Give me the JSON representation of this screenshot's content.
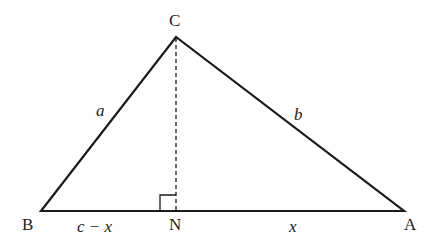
{
  "diagram": {
    "type": "triangle",
    "vertices": {
      "A": "A",
      "B": "B",
      "C": "C",
      "N": "N"
    },
    "sides": {
      "a": "a",
      "b": "b",
      "c_minus_x": "c − x",
      "x": "x"
    },
    "altitude": "CN (dashed, perpendicular to BA)",
    "right_angle_marker": "at N"
  },
  "colors": {
    "stroke": "#1a1a1a",
    "background": "#ffffff"
  }
}
